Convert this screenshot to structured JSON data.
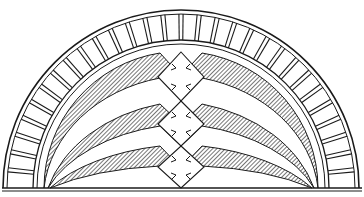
{
  "figure": {
    "subject": "Semicircular arch lunette with voussoirs and diamond cross ornaments",
    "ink_color": "#1a1a1a",
    "paper_color": "#ffffff",
    "voussoir_count": 30,
    "band_count": 3,
    "ornament_count": 3
  }
}
